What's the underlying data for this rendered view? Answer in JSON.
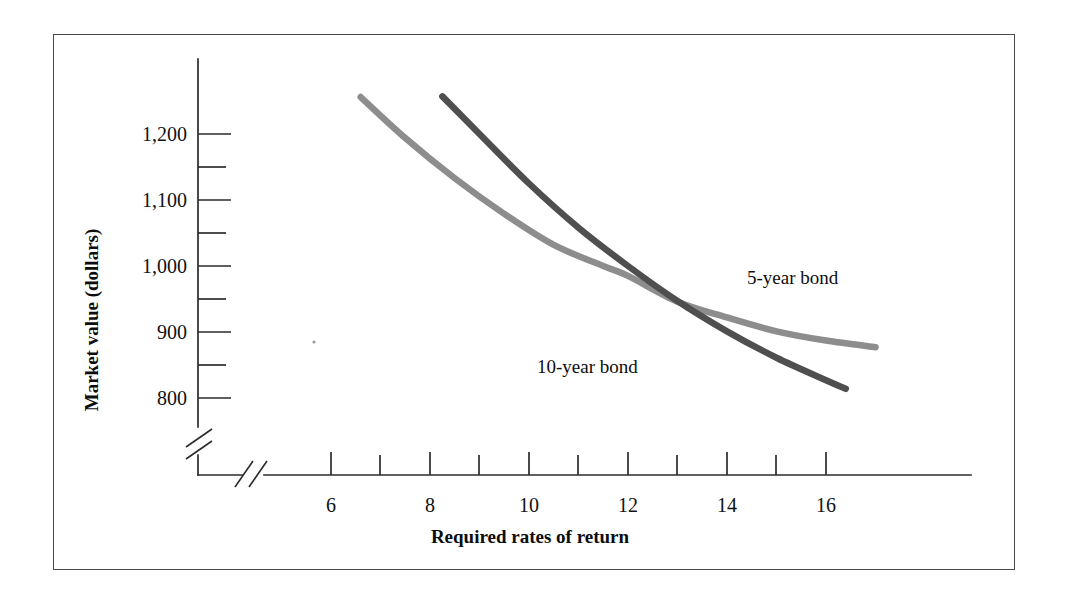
{
  "chart_data": {
    "type": "line",
    "title": "",
    "xlabel": "Required rates of return",
    "ylabel": "Market value (dollars)",
    "xlim": [
      5,
      17.4
    ],
    "ylim": [
      760,
      1260
    ],
    "grid": false,
    "legend_position": "inline-right",
    "axis_breaks": {
      "x": true,
      "y": true
    },
    "x_major_ticks": [
      6,
      8,
      10,
      12,
      14,
      16
    ],
    "x_minor_ticks": [
      7,
      9,
      11,
      13,
      15
    ],
    "x_tick_labels": [
      "6",
      "8",
      "10",
      "12",
      "14",
      "16"
    ],
    "y_major_ticks": [
      800,
      900,
      1000,
      1100,
      1200
    ],
    "y_minor_ticks": [
      850,
      950,
      1050,
      1150
    ],
    "y_tick_labels": [
      "800",
      "900",
      "1,000",
      "1,100",
      "1,200"
    ],
    "series": [
      {
        "name": "5-year bond",
        "color": "#8d8d8d",
        "label": "5-year bond",
        "x": [
          6.6,
          7.5,
          8.5,
          9.5,
          10.5,
          11.5,
          12.0,
          13.0,
          14.0,
          15.0,
          16.0,
          17.0
        ],
        "values": [
          1256,
          1194,
          1133,
          1079,
          1032,
          1000,
          985,
          946,
          922,
          901,
          887,
          877
        ]
      },
      {
        "name": "10-year bond",
        "color": "#4f4f4f",
        "label": "10-year bond",
        "x": [
          8.25,
          9.0,
          10.0,
          11.0,
          12.0,
          13.0,
          14.0,
          15.0,
          16.0,
          16.4
        ],
        "values": [
          1257,
          1200,
          1125,
          1058,
          1000,
          947,
          901,
          861,
          827,
          814
        ]
      }
    ],
    "annotations": [
      {
        "text": "5-year bond",
        "x": 14.35,
        "y": 975
      },
      {
        "text": "10-year bond",
        "x": 11.15,
        "y": 877
      }
    ]
  },
  "figure": {
    "border_color": "#4a4a4a",
    "background": "#ffffff"
  }
}
